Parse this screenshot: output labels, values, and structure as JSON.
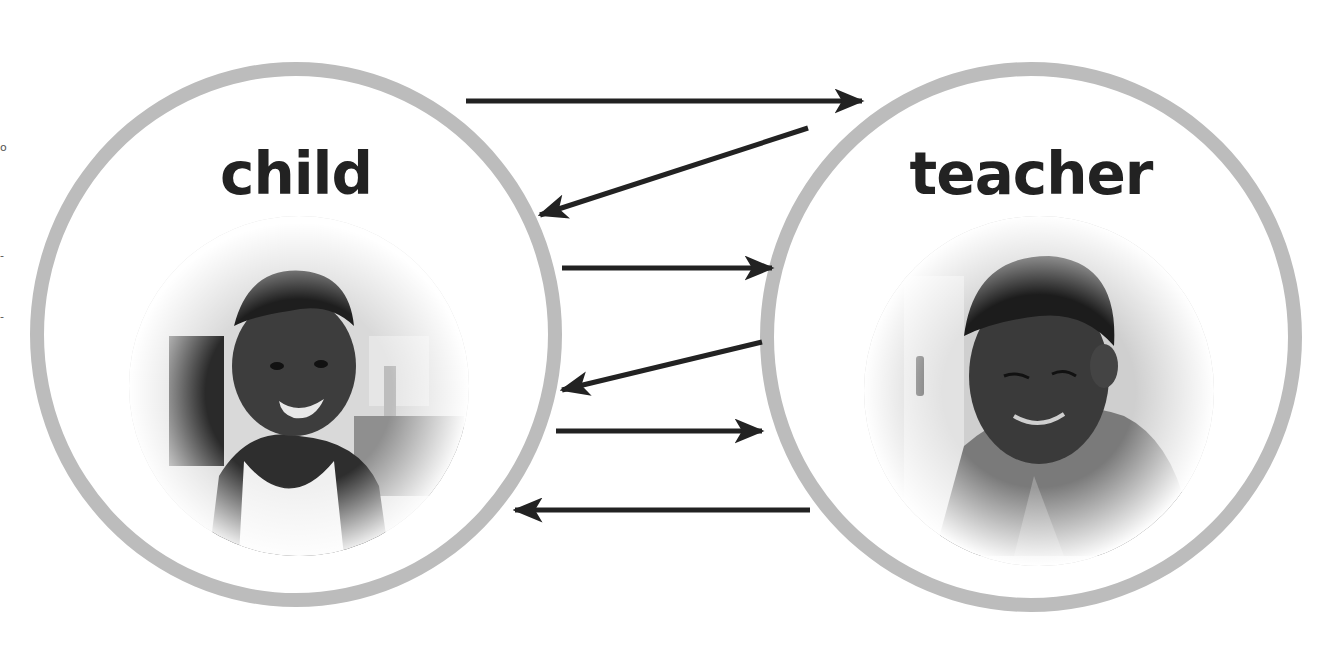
{
  "diagram": {
    "type": "interaction-diagram",
    "colors": {
      "ring": "#bcbcbc",
      "arrow": "#222222",
      "label": "#222222",
      "background": "#ffffff"
    },
    "nodes": [
      {
        "id": "child",
        "label": "child",
        "photo": "grayscale-photo-of-smiling-toddler"
      },
      {
        "id": "teacher",
        "label": "teacher",
        "photo": "grayscale-photo-of-adult-looking-down"
      }
    ],
    "arrows": [
      {
        "from": "child",
        "to": "teacher",
        "x1": 466,
        "y1": 101,
        "x2": 862,
        "y2": 101
      },
      {
        "from": "teacher",
        "to": "child",
        "x1": 808,
        "y1": 128,
        "x2": 540,
        "y2": 215
      },
      {
        "from": "child",
        "to": "teacher",
        "x1": 562,
        "y1": 268,
        "x2": 772,
        "y2": 268
      },
      {
        "from": "teacher",
        "to": "child",
        "x1": 762,
        "y1": 342,
        "x2": 562,
        "y2": 390
      },
      {
        "from": "child",
        "to": "teacher",
        "x1": 556,
        "y1": 431,
        "x2": 762,
        "y2": 431
      },
      {
        "from": "teacher",
        "to": "child",
        "x1": 810,
        "y1": 510,
        "x2": 515,
        "y2": 510
      }
    ],
    "edge_marks": [
      "o",
      "-",
      "-"
    ]
  }
}
